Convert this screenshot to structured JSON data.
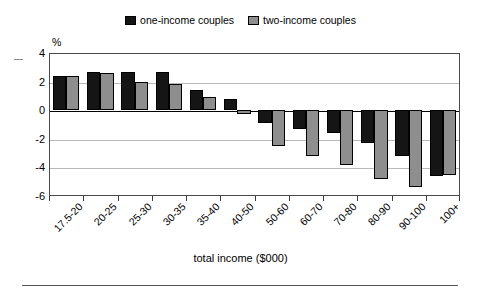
{
  "chart_data": {
    "type": "bar",
    "title": "",
    "xlabel": "total income ($000)",
    "ylabel": "%",
    "ylim": [
      -6,
      4
    ],
    "yticks": [
      4,
      2,
      0,
      -2,
      -4,
      -6
    ],
    "ytick_labels": [
      "4",
      "2",
      "0",
      "-2",
      "-4",
      "-6"
    ],
    "grid": true,
    "legend_position": "top-center",
    "categories": [
      "17.5-20",
      "20-25",
      "25-30",
      "30-35",
      "35-40",
      "40-50",
      "50-60",
      "60-70",
      "70-80",
      "80-90",
      "90-100",
      "100+"
    ],
    "series": [
      {
        "name": "one-income couples",
        "color": "#151515",
        "values": [
          2.4,
          2.7,
          2.7,
          2.7,
          1.4,
          0.8,
          -0.9,
          -1.3,
          -1.6,
          -2.3,
          -3.2,
          -4.6
        ]
      },
      {
        "name": "two-income couples",
        "color": "#8e8e8e",
        "values": [
          2.4,
          2.6,
          2.0,
          1.8,
          0.9,
          -0.3,
          -2.5,
          -3.2,
          -3.8,
          -4.8,
          -5.4,
          -4.5
        ]
      }
    ]
  },
  "legend": {
    "entries": [
      {
        "label": "one-income couples",
        "swatch": "#151515"
      },
      {
        "label": "two-income couples",
        "swatch": "#8e8e8e"
      }
    ]
  },
  "axes": {
    "y_unit_label": "%",
    "x_axis_title": "total income ($000)"
  }
}
